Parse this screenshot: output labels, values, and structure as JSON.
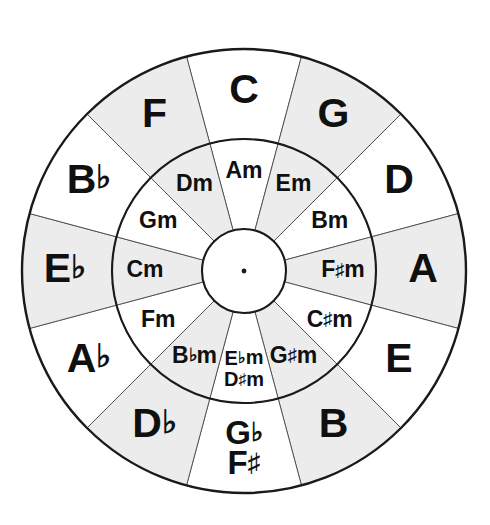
{
  "diagram": {
    "geometry": {
      "center_x": 244,
      "center_y": 271,
      "outer_radius": 222,
      "ring_divider_radius": 132,
      "hub_radius": 42,
      "sector_count": 12,
      "sector_degrees": 30
    },
    "colors": {
      "shaded_sector": "#ececec",
      "plain_sector": "#ffffff",
      "outline": "#1a1a1a",
      "divider": "#555555",
      "text": "#101010",
      "background": "#ffffff"
    },
    "outer_ring": [
      {
        "label": "C",
        "root": "C",
        "accidental": "",
        "alt_label": "",
        "alt_root": "",
        "alt_accidental": "",
        "angle": 0,
        "shaded": false
      },
      {
        "label": "G",
        "root": "G",
        "accidental": "",
        "alt_label": "",
        "alt_root": "",
        "alt_accidental": "",
        "angle": 30,
        "shaded": true
      },
      {
        "label": "D",
        "root": "D",
        "accidental": "",
        "alt_label": "",
        "alt_root": "",
        "alt_accidental": "",
        "angle": 60,
        "shaded": false
      },
      {
        "label": "A",
        "root": "A",
        "accidental": "",
        "alt_label": "",
        "alt_root": "",
        "alt_accidental": "",
        "angle": 90,
        "shaded": true
      },
      {
        "label": "E",
        "root": "E",
        "accidental": "",
        "alt_label": "",
        "alt_root": "",
        "alt_accidental": "",
        "angle": 120,
        "shaded": false
      },
      {
        "label": "B",
        "root": "B",
        "accidental": "",
        "alt_label": "",
        "alt_root": "",
        "alt_accidental": "",
        "angle": 150,
        "shaded": true
      },
      {
        "label": "G♭",
        "root": "G",
        "accidental": "♭",
        "alt_label": "F♯",
        "alt_root": "F",
        "alt_accidental": "♯",
        "angle": 180,
        "shaded": false
      },
      {
        "label": "D♭",
        "root": "D",
        "accidental": "♭",
        "alt_label": "",
        "alt_root": "",
        "alt_accidental": "",
        "angle": 210,
        "shaded": true
      },
      {
        "label": "A♭",
        "root": "A",
        "accidental": "♭",
        "alt_label": "",
        "alt_root": "",
        "alt_accidental": "",
        "angle": 240,
        "shaded": false
      },
      {
        "label": "E♭",
        "root": "E",
        "accidental": "♭",
        "alt_label": "",
        "alt_root": "",
        "alt_accidental": "",
        "angle": 270,
        "shaded": true
      },
      {
        "label": "B♭",
        "root": "B",
        "accidental": "♭",
        "alt_label": "",
        "alt_root": "",
        "alt_accidental": "",
        "angle": 300,
        "shaded": false
      },
      {
        "label": "F",
        "root": "F",
        "accidental": "",
        "alt_label": "",
        "alt_root": "",
        "alt_accidental": "",
        "angle": 330,
        "shaded": true
      }
    ],
    "inner_ring": [
      {
        "label": "Am",
        "root": "A",
        "accidental": "",
        "suffix": "m",
        "alt_label": "",
        "alt_root": "",
        "alt_accidental": "",
        "alt_suffix": "",
        "angle": 0,
        "shaded": false
      },
      {
        "label": "Em",
        "root": "E",
        "accidental": "",
        "suffix": "m",
        "alt_label": "",
        "alt_root": "",
        "alt_accidental": "",
        "alt_suffix": "",
        "angle": 30,
        "shaded": true
      },
      {
        "label": "Bm",
        "root": "B",
        "accidental": "",
        "suffix": "m",
        "alt_label": "",
        "alt_root": "",
        "alt_accidental": "",
        "alt_suffix": "",
        "angle": 60,
        "shaded": false
      },
      {
        "label": "F♯m",
        "root": "F",
        "accidental": "♯",
        "suffix": "m",
        "alt_label": "",
        "alt_root": "",
        "alt_accidental": "",
        "alt_suffix": "",
        "angle": 90,
        "shaded": true
      },
      {
        "label": "C♯m",
        "root": "C",
        "accidental": "♯",
        "suffix": "m",
        "alt_label": "",
        "alt_root": "",
        "alt_accidental": "",
        "alt_suffix": "",
        "angle": 120,
        "shaded": false
      },
      {
        "label": "G♯m",
        "root": "G",
        "accidental": "♯",
        "suffix": "m",
        "alt_label": "",
        "alt_root": "",
        "alt_accidental": "",
        "alt_suffix": "",
        "angle": 150,
        "shaded": true
      },
      {
        "label": "E♭m",
        "root": "E",
        "accidental": "♭",
        "suffix": "m",
        "alt_label": "D♯m",
        "alt_root": "D",
        "alt_accidental": "♯",
        "alt_suffix": "m",
        "angle": 180,
        "shaded": false
      },
      {
        "label": "B♭m",
        "root": "B",
        "accidental": "♭",
        "suffix": "m",
        "alt_label": "",
        "alt_root": "",
        "alt_accidental": "",
        "alt_suffix": "",
        "angle": 210,
        "shaded": true
      },
      {
        "label": "Fm",
        "root": "F",
        "accidental": "",
        "suffix": "m",
        "alt_label": "",
        "alt_root": "",
        "alt_accidental": "",
        "alt_suffix": "",
        "angle": 240,
        "shaded": false
      },
      {
        "label": "Cm",
        "root": "C",
        "accidental": "",
        "suffix": "m",
        "alt_label": "",
        "alt_root": "",
        "alt_accidental": "",
        "alt_suffix": "",
        "angle": 270,
        "shaded": true
      },
      {
        "label": "Gm",
        "root": "G",
        "accidental": "",
        "suffix": "m",
        "alt_label": "",
        "alt_root": "",
        "alt_accidental": "",
        "alt_suffix": "",
        "angle": 300,
        "shaded": false
      },
      {
        "label": "Dm",
        "root": "D",
        "accidental": "",
        "suffix": "m",
        "alt_label": "",
        "alt_root": "",
        "alt_accidental": "",
        "alt_suffix": "",
        "angle": 330,
        "shaded": true
      }
    ]
  }
}
